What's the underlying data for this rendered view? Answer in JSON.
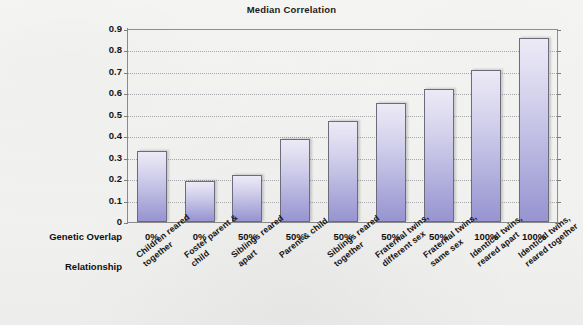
{
  "chart_data": {
    "type": "bar",
    "title": "Median Correlation",
    "xlabel": "Relationship",
    "ylabel": "",
    "ylim": [
      0,
      0.9
    ],
    "ytick_labels": [
      "0.9",
      "0.8",
      "0.7",
      "0.6",
      "0.5",
      "0.4",
      "0.3",
      "0.2",
      "0.1",
      "0"
    ],
    "ytick_values": [
      0.9,
      0.8,
      0.7,
      0.6,
      0.5,
      0.4,
      0.3,
      0.2,
      0.1,
      0
    ],
    "grid": true,
    "legend": "none",
    "categories": [
      "Children reared\ntogether",
      "Foster parent &\nchild",
      "Siblings reared\napart",
      "Parent & child",
      "Siblings reared\ntogether",
      "Fraternal twins,\ndifferent sex",
      "Fraternal twins,\nsame sex",
      "Identical twins,\nreared apart",
      "Identical twins,\nreared together"
    ],
    "values": [
      0.33,
      0.19,
      0.22,
      0.385,
      0.47,
      0.555,
      0.62,
      0.71,
      0.86
    ],
    "genetic_overlap": [
      "0%",
      "0%",
      "50%",
      "50%",
      "50%",
      "50%",
      "50%",
      "100%",
      "100%"
    ],
    "bar_color_top": "#ECEAF6",
    "bar_color_bottom": "#9794D0",
    "bar_border_color": "#6B6B7A"
  },
  "labels": {
    "genetic_overlap_header": "Genetic Overlap",
    "relationship_header": "Relationship"
  }
}
